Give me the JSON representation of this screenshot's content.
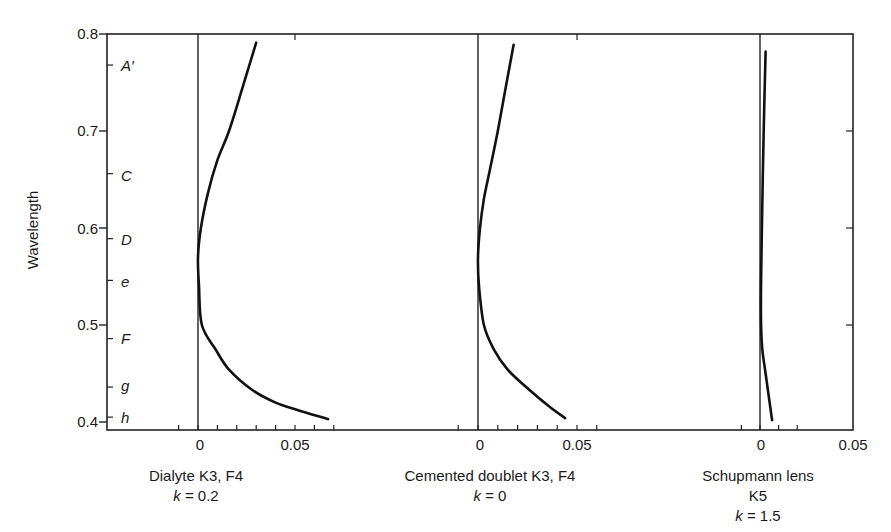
{
  "chart_data": {
    "type": "line",
    "title": "",
    "ylabel": "Wavelength",
    "ylim": [
      0.4,
      0.8
    ],
    "yticks": [
      "0.4",
      "0.5",
      "0.6",
      "0.7",
      "0.8"
    ],
    "spectral_lines": [
      {
        "label": "A′",
        "wavelength": 0.768
      },
      {
        "label": "C",
        "wavelength": 0.656
      },
      {
        "label": "D",
        "wavelength": 0.589
      },
      {
        "label": "e",
        "wavelength": 0.546
      },
      {
        "label": "F",
        "wavelength": 0.486
      },
      {
        "label": "g",
        "wavelength": 0.436
      },
      {
        "label": "h",
        "wavelength": 0.405
      }
    ],
    "panels": [
      {
        "name": "Dialyte K3, F4",
        "k_label": "k = 0.2",
        "xticks": [
          "0",
          "0.05"
        ],
        "xlim": [
          -0.01,
          0.085
        ],
        "points": [
          {
            "x": 0.03,
            "y": 0.791
          },
          {
            "x": 0.023,
            "y": 0.745
          },
          {
            "x": 0.016,
            "y": 0.7
          },
          {
            "x": 0.01,
            "y": 0.67
          },
          {
            "x": 0.005,
            "y": 0.635
          },
          {
            "x": 0.0015,
            "y": 0.6
          },
          {
            "x": 0.0,
            "y": 0.57
          },
          {
            "x": 0.0005,
            "y": 0.54
          },
          {
            "x": 0.002,
            "y": 0.5
          },
          {
            "x": 0.009,
            "y": 0.475
          },
          {
            "x": 0.016,
            "y": 0.454
          },
          {
            "x": 0.028,
            "y": 0.433
          },
          {
            "x": 0.04,
            "y": 0.42
          },
          {
            "x": 0.052,
            "y": 0.412
          },
          {
            "x": 0.067,
            "y": 0.403
          }
        ]
      },
      {
        "name": "Cemented doublet K3, F4",
        "k_label": "k = 0",
        "xticks": [
          "0",
          "0.05"
        ],
        "xlim": [
          -0.01,
          0.075
        ],
        "points": [
          {
            "x": 0.018,
            "y": 0.789
          },
          {
            "x": 0.014,
            "y": 0.745
          },
          {
            "x": 0.01,
            "y": 0.7
          },
          {
            "x": 0.006,
            "y": 0.66
          },
          {
            "x": 0.003,
            "y": 0.63
          },
          {
            "x": 0.001,
            "y": 0.6
          },
          {
            "x": 0.0,
            "y": 0.57
          },
          {
            "x": 0.0005,
            "y": 0.54
          },
          {
            "x": 0.003,
            "y": 0.5
          },
          {
            "x": 0.008,
            "y": 0.475
          },
          {
            "x": 0.015,
            "y": 0.454
          },
          {
            "x": 0.026,
            "y": 0.433
          },
          {
            "x": 0.036,
            "y": 0.416
          },
          {
            "x": 0.044,
            "y": 0.404
          }
        ]
      },
      {
        "name": "Schupmann lens K5",
        "k_label": "k = 1.5",
        "xticks": [
          "0",
          "0.05"
        ],
        "xlim": [
          -0.01,
          0.05
        ],
        "points": [
          {
            "x": 0.003,
            "y": 0.782
          },
          {
            "x": 0.002,
            "y": 0.7
          },
          {
            "x": 0.001,
            "y": 0.6
          },
          {
            "x": 0.0005,
            "y": 0.52
          },
          {
            "x": 0.001,
            "y": 0.48
          },
          {
            "x": 0.003,
            "y": 0.45
          },
          {
            "x": 0.0065,
            "y": 0.402
          }
        ]
      }
    ]
  },
  "labels": {
    "ylabel": "Wavelength",
    "yticks": {
      "y08": "0.8",
      "y07": "0.7",
      "y06": "0.6",
      "y05": "0.5",
      "y04": "0.4"
    },
    "lines": {
      "A": "A′",
      "C": "C",
      "D": "D",
      "e": "e",
      "F": "F",
      "g": "g",
      "h": "h"
    },
    "p1": {
      "x0": "0",
      "x05": "0.05",
      "name": "Dialyte K3, F4",
      "k": "k",
      "kval": " = 0.2"
    },
    "p2": {
      "x0": "0",
      "x05": "0.05",
      "name": "Cemented doublet K3, F4",
      "k": "k",
      "kval": " = 0"
    },
    "p3": {
      "x0": "0",
      "x05": "0.05",
      "name": "Schupmann lens K5",
      "k": "k",
      "kval": " = 1.5"
    }
  }
}
